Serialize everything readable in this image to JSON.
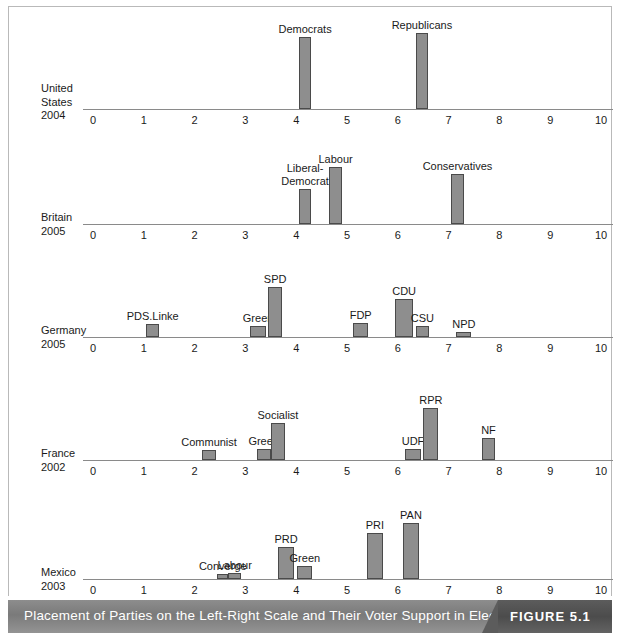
{
  "caption": {
    "title": "Placement of Parties on the Left-Right Scale and Their Voter Support in Election",
    "figure_tag": "FIGURE 5.1"
  },
  "chart_data": {
    "type": "bar",
    "title": "Placement of Parties on the Left-Right Scale and Their Voter Support in Election",
    "xlabel": "Left-Right Scale",
    "ylabel": "Voter Support in Election",
    "xlim": [
      0,
      10
    ],
    "grid": false,
    "legend": "none",
    "tick_labels": [
      "0",
      "1",
      "2",
      "3",
      "4",
      "5",
      "6",
      "7",
      "8",
      "9",
      "10"
    ],
    "panels": [
      {
        "country": "United States",
        "year": "2004",
        "row_label": "United\nStates\n2004",
        "bars": [
          {
            "label": "Democrats",
            "x_start": 4.05,
            "x_end": 4.3,
            "height": 72
          },
          {
            "label": "Republicans",
            "x_start": 6.35,
            "x_end": 6.6,
            "height": 76
          }
        ]
      },
      {
        "country": "Britain",
        "year": "2005",
        "row_label": "Britain\n2005",
        "bars": [
          {
            "label": "Liberal-\nDemocrat",
            "x_start": 4.05,
            "x_end": 4.3,
            "height": 35
          },
          {
            "label": "Labour",
            "x_start": 4.65,
            "x_end": 4.9,
            "height": 57
          },
          {
            "label": "Conservatives",
            "x_start": 7.05,
            "x_end": 7.3,
            "height": 50
          }
        ]
      },
      {
        "country": "Germany",
        "year": "2005",
        "row_label": "Germany\n2005",
        "bars": [
          {
            "label": "PDS.Linke",
            "x_start": 1.05,
            "x_end": 1.3,
            "height": 13
          },
          {
            "label": "Green",
            "x_start": 3.1,
            "x_end": 3.4,
            "height": 11
          },
          {
            "label": "SPD",
            "x_start": 3.45,
            "x_end": 3.72,
            "height": 50
          },
          {
            "label": "FDP",
            "x_start": 5.12,
            "x_end": 5.42,
            "height": 14
          },
          {
            "label": "CDU",
            "x_start": 5.95,
            "x_end": 6.3,
            "height": 38
          },
          {
            "label": "CSU",
            "x_start": 6.35,
            "x_end": 6.62,
            "height": 11
          },
          {
            "label": "NPD",
            "x_start": 7.15,
            "x_end": 7.45,
            "height": 5
          }
        ]
      },
      {
        "country": "France",
        "year": "2002",
        "row_label": "France\n2002",
        "bars": [
          {
            "label": "Communist",
            "x_start": 2.15,
            "x_end": 2.42,
            "height": 10
          },
          {
            "label": "Green",
            "x_start": 3.22,
            "x_end": 3.5,
            "height": 11
          },
          {
            "label": "Socialist",
            "x_start": 3.5,
            "x_end": 3.78,
            "height": 37
          },
          {
            "label": "UDF",
            "x_start": 6.15,
            "x_end": 6.45,
            "height": 11
          },
          {
            "label": "RPR",
            "x_start": 6.5,
            "x_end": 6.8,
            "height": 52
          },
          {
            "label": "NF",
            "x_start": 7.65,
            "x_end": 7.92,
            "height": 22
          }
        ]
      },
      {
        "country": "Mexico",
        "year": "2003",
        "row_label": "Mexico\n2003",
        "bars": [
          {
            "label": "Converge",
            "x_start": 2.45,
            "x_end": 2.66,
            "height": 5
          },
          {
            "label": "Labour",
            "x_start": 2.66,
            "x_end": 2.92,
            "height": 6
          },
          {
            "label": "PRD",
            "x_start": 3.65,
            "x_end": 3.95,
            "height": 32
          },
          {
            "label": "Green",
            "x_start": 4.02,
            "x_end": 4.32,
            "height": 13
          },
          {
            "label": "PRI",
            "x_start": 5.4,
            "x_end": 5.7,
            "height": 46
          },
          {
            "label": "PAN",
            "x_start": 6.1,
            "x_end": 6.42,
            "height": 56
          }
        ]
      }
    ]
  },
  "layout": {
    "axis_x0_px": 84,
    "axis_unit_px": 50.8,
    "panel_tops": [
      0,
      121,
      243,
      365,
      487
    ],
    "baseline_offsets": [
      102,
      96,
      87,
      88,
      85
    ],
    "label_left_px": 32,
    "row_label_tops": [
      78,
      200,
      311,
      434,
      552
    ]
  },
  "colors": {
    "bar_fill": "#8e8e8e",
    "bar_stroke": "#4a4a4a",
    "axis": "#8a8a8a",
    "text": "#1a1a1a",
    "caption_bg": "#7a7a7a",
    "caption_text": "#ffffff",
    "frame": "#b9b9b9"
  }
}
